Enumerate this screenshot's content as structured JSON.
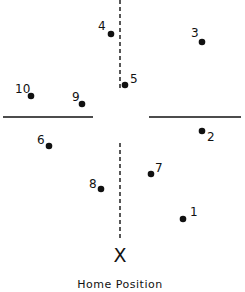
{
  "diagram": {
    "caption": "Home Position",
    "home_marker": "X",
    "colors": {
      "ink": "#111111",
      "background": "#ffffff"
    },
    "points": [
      {
        "label": "1",
        "x": 183,
        "y": 219,
        "lx": 190,
        "ly": 216
      },
      {
        "label": "2",
        "x": 202,
        "y": 131,
        "lx": 207,
        "ly": 141
      },
      {
        "label": "3",
        "x": 202,
        "y": 42,
        "lx": 191,
        "ly": 37
      },
      {
        "label": "4",
        "x": 111,
        "y": 34,
        "lx": 98,
        "ly": 30
      },
      {
        "label": "5",
        "x": 125,
        "y": 85,
        "lx": 130,
        "ly": 83
      },
      {
        "label": "6",
        "x": 49,
        "y": 146,
        "lx": 37,
        "ly": 144
      },
      {
        "label": "7",
        "x": 151,
        "y": 174,
        "lx": 155,
        "ly": 172
      },
      {
        "label": "8",
        "x": 101,
        "y": 189,
        "lx": 89,
        "ly": 188
      },
      {
        "label": "9",
        "x": 82,
        "y": 104,
        "lx": 72,
        "ly": 101
      },
      {
        "label": "10",
        "x": 31,
        "y": 96,
        "lx": 15,
        "ly": 93
      }
    ]
  }
}
